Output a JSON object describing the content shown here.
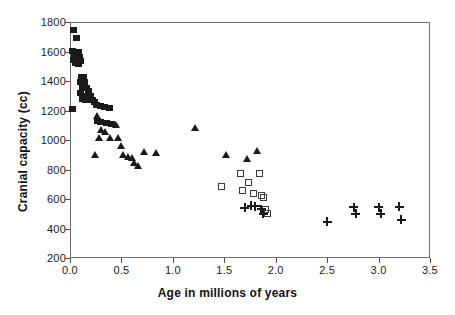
{
  "chart_data": {
    "type": "scatter",
    "title": "",
    "xlabel": "Age in millions of years",
    "ylabel": "Cranial capacity (cc)",
    "xlim": [
      0.0,
      3.5
    ],
    "ylim": [
      200,
      1800
    ],
    "xticks": [
      "0.0",
      "0.5",
      "1.0",
      "1.5",
      "2.0",
      "2.5",
      "3.0",
      "3.5"
    ],
    "xtick_values": [
      0.0,
      0.5,
      1.0,
      1.5,
      2.0,
      2.5,
      3.0,
      3.5
    ],
    "yticks": [
      "200",
      "400",
      "600",
      "800",
      "1000",
      "1200",
      "1400",
      "1600",
      "1800"
    ],
    "ytick_values": [
      200,
      400,
      600,
      800,
      1000,
      1200,
      1400,
      1600,
      1800
    ],
    "grid": false,
    "legend": "none",
    "frame": true,
    "series": [
      {
        "name": "filled-square",
        "marker": "filled-square",
        "color": "#1a1a1a",
        "points": [
          [
            0.03,
            1745
          ],
          [
            0.06,
            1690
          ],
          [
            0.02,
            1605
          ],
          [
            0.05,
            1600
          ],
          [
            0.08,
            1595
          ],
          [
            0.04,
            1570
          ],
          [
            0.07,
            1560
          ],
          [
            0.09,
            1565
          ],
          [
            0.03,
            1545
          ],
          [
            0.06,
            1540
          ],
          [
            0.1,
            1535
          ],
          [
            0.05,
            1520
          ],
          [
            0.08,
            1515
          ],
          [
            0.11,
            1430
          ],
          [
            0.13,
            1425
          ],
          [
            0.1,
            1395
          ],
          [
            0.14,
            1390
          ],
          [
            0.12,
            1355
          ],
          [
            0.16,
            1350
          ],
          [
            0.1,
            1320
          ],
          [
            0.18,
            1330
          ],
          [
            0.13,
            1300
          ],
          [
            0.16,
            1295
          ],
          [
            0.2,
            1300
          ],
          [
            0.12,
            1275
          ],
          [
            0.15,
            1270
          ],
          [
            0.19,
            1272
          ],
          [
            0.22,
            1268
          ],
          [
            0.24,
            1255
          ],
          [
            0.02,
            1210
          ],
          [
            0.26,
            1240
          ],
          [
            0.3,
            1232
          ],
          [
            0.34,
            1222
          ],
          [
            0.38,
            1215
          ],
          [
            0.27,
            1130
          ],
          [
            0.3,
            1122
          ],
          [
            0.35,
            1112
          ],
          [
            0.4,
            1108
          ]
        ]
      },
      {
        "name": "filled-triangle",
        "marker": "filled-triangle",
        "color": "#1a1a1a",
        "points": [
          [
            0.26,
            1165
          ],
          [
            0.3,
            1072
          ],
          [
            0.34,
            1060
          ],
          [
            0.28,
            1020
          ],
          [
            0.39,
            1018
          ],
          [
            0.24,
            905
          ],
          [
            0.45,
            1105
          ],
          [
            0.47,
            1020
          ],
          [
            0.5,
            960
          ],
          [
            0.52,
            905
          ],
          [
            0.56,
            890
          ],
          [
            0.6,
            880
          ],
          [
            0.62,
            845
          ],
          [
            0.66,
            830
          ],
          [
            0.72,
            920
          ],
          [
            0.84,
            915
          ],
          [
            1.22,
            1085
          ],
          [
            1.52,
            905
          ],
          [
            1.72,
            875
          ],
          [
            1.82,
            930
          ]
        ]
      },
      {
        "name": "open-square",
        "marker": "open-square",
        "color": "#3a3a3a",
        "points": [
          [
            1.47,
            688
          ],
          [
            1.66,
            775
          ],
          [
            1.68,
            660
          ],
          [
            1.74,
            710
          ],
          [
            1.78,
            640
          ],
          [
            1.84,
            772
          ],
          [
            1.86,
            625
          ],
          [
            1.88,
            610
          ],
          [
            1.9,
            530
          ],
          [
            1.92,
            505
          ]
        ]
      },
      {
        "name": "plus",
        "marker": "plus",
        "color": "#1a1a1a",
        "points": [
          [
            1.7,
            540
          ],
          [
            1.76,
            555
          ],
          [
            1.8,
            552
          ],
          [
            1.86,
            530
          ],
          [
            1.88,
            500
          ],
          [
            2.5,
            445
          ],
          [
            2.76,
            545
          ],
          [
            2.78,
            500
          ],
          [
            3.0,
            545
          ],
          [
            3.02,
            500
          ],
          [
            3.2,
            548
          ],
          [
            3.22,
            460
          ]
        ]
      }
    ]
  }
}
